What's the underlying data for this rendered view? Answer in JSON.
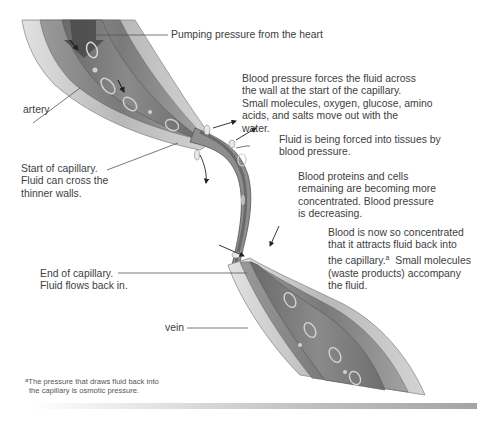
{
  "diagram": {
    "labels": {
      "pumping": "Pumping pressure from the heart",
      "artery": "artery",
      "blood_pressure_forces": [
        "Blood pressure forces the fluid across",
        "the wall at the start of the capillary.",
        "Small molecules, oxygen, glucose, amino",
        "acids, and salts move out with the",
        "water."
      ],
      "fluid_forced": [
        "Fluid is being forced into tissues by",
        "blood pressure."
      ],
      "start_capillary": [
        "Start of capillary.",
        "Fluid can cross the",
        "thinner walls."
      ],
      "proteins_concentrated": [
        "Blood proteins and cells",
        "remaining are becoming more",
        "concentrated. Blood pressure",
        "is decreasing."
      ],
      "concentrated_attracts": {
        "line1": "Blood is now so concentrated",
        "line2": "that it attracts fluid back into",
        "line3_pre": "the capillary.",
        "line3_sup": "a",
        "line3_post": "  Small molecules",
        "line4": "(waste products) accompany",
        "line5": "the fluid."
      },
      "end_capillary": [
        "End of capillary.",
        "Fluid flows back in."
      ],
      "vein": "vein"
    },
    "footnote": {
      "marker": "a",
      "line1": "The pressure that draws fluid back into",
      "line2": "the capillary is osmotic pressure."
    },
    "colors": {
      "vessel_outer": "#bdbdbd",
      "vessel_wall": "#8f8f8f",
      "lumen": "#6f6f6f",
      "leader_line": "#555555",
      "text": "#404040"
    }
  }
}
